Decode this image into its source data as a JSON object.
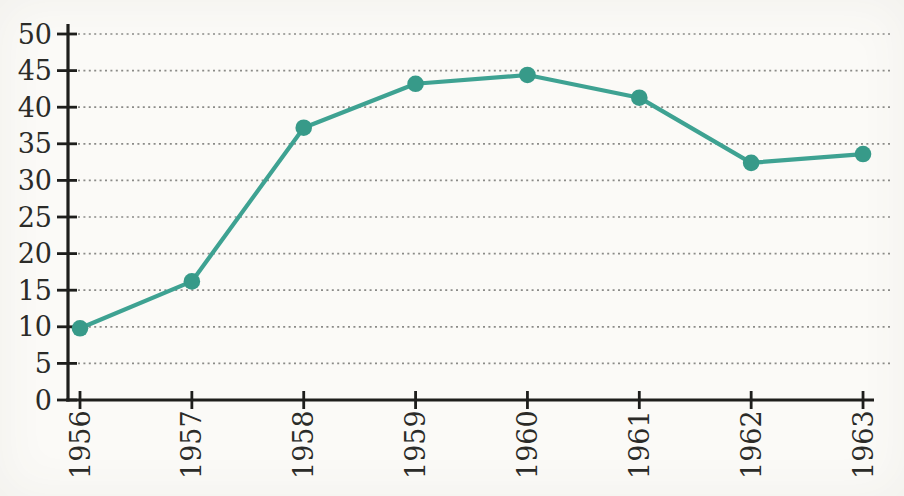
{
  "page": {
    "background_color": "#fbfaf7"
  },
  "chart_data": {
    "type": "line",
    "title": "",
    "xlabel": "",
    "ylabel": "",
    "categories": [
      "1956",
      "1957",
      "1958",
      "1959",
      "1960",
      "1961",
      "1962",
      "1963"
    ],
    "values": [
      9.8,
      16.2,
      37.2,
      43.2,
      44.4,
      41.3,
      32.4,
      33.6
    ],
    "ylim": [
      0,
      50
    ],
    "y_ticks": [
      0,
      5,
      10,
      15,
      20,
      25,
      30,
      35,
      40,
      45,
      50
    ],
    "grid": "horizontal-dotted",
    "legend": "none",
    "x_tick_label_rotation": -90,
    "marker": "circle",
    "series_color": "#3ea292",
    "marker_color": "#379a89",
    "axis_color": "#1e1e1c",
    "grid_color": "#8b8b88",
    "label_color": "#2b2b28"
  }
}
